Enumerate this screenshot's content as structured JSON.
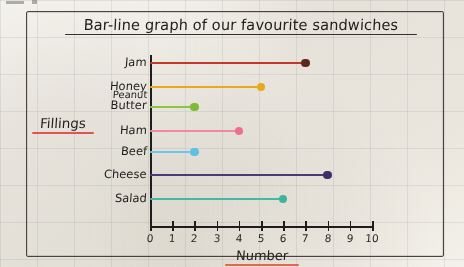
{
  "page": {
    "surface": "graph-paper",
    "paper_color": "#f3f1ec",
    "ink_color": "#201e1c"
  },
  "frame": {
    "border_color": "#4a443e"
  },
  "chart_data": {
    "type": "bar",
    "orientation": "horizontal",
    "title": "Bar-line graph of our favourite sandwiches",
    "xlabel": "Number",
    "ylabel": "Fillings",
    "categories": [
      "Jam",
      "Honey",
      "Peanut Butter",
      "Ham",
      "Beef",
      "Cheese",
      "Salad"
    ],
    "values": [
      7,
      5,
      2,
      4,
      2,
      8,
      6
    ],
    "colors": [
      "#c0392b",
      "#eaa81e",
      "#8cc63f",
      "#f08a9e",
      "#6ec6e8",
      "#4b3a78",
      "#42b8a8"
    ],
    "dot_colors": [
      "#5a2a1c",
      "#e8a81d",
      "#7dbb37",
      "#ef6f8a",
      "#5fc0e4",
      "#3e2f68",
      "#3cb39e"
    ],
    "xlim": [
      0,
      10
    ],
    "xticks": [
      0,
      1,
      2,
      3,
      4,
      5,
      6,
      7,
      8,
      9,
      10
    ],
    "xtick_labels": [
      "0",
      "1",
      "2",
      "3",
      "4",
      "5",
      "6",
      "7",
      "8",
      "9",
      "10"
    ],
    "grid": true,
    "legend": "none",
    "label_lines": {
      "Peanut Butter": [
        "Peanut",
        "Butter"
      ]
    }
  }
}
